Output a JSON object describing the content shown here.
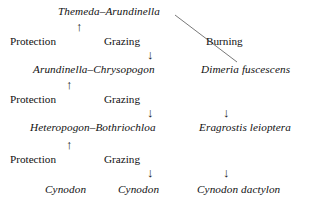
{
  "diagram": {
    "background_color": "#ffffff",
    "text_color": "#111111",
    "nodes": [
      {
        "label": "Themeda–Arundinella",
        "x": 58,
        "y": 6
      },
      {
        "label": "Arundinella–Chrysopogon",
        "x": 33,
        "y": 64
      },
      {
        "label": "Dimeria fuscescens",
        "x": 201,
        "y": 64
      },
      {
        "label": "Heteropogon–Bothriochloa",
        "x": 30,
        "y": 122
      },
      {
        "label": "Eragrostis leioptera",
        "x": 199,
        "y": 122
      },
      {
        "label": "Cynodon",
        "x": 45,
        "y": 184
      },
      {
        "label": "Cynodon",
        "x": 118,
        "y": 184
      },
      {
        "label": "Cynodon dactylon",
        "x": 197,
        "y": 184
      }
    ],
    "factors": [
      {
        "label": "Protection",
        "x": 10,
        "y": 36
      },
      {
        "label": "Grazing",
        "x": 104,
        "y": 36
      },
      {
        "label": "Burning",
        "x": 206,
        "y": 36
      },
      {
        "label": "Protection",
        "x": 10,
        "y": 94
      },
      {
        "label": "Grazing",
        "x": 104,
        "y": 94
      },
      {
        "label": "Protection",
        "x": 10,
        "y": 154
      },
      {
        "label": "Grazing",
        "x": 104,
        "y": 154
      }
    ],
    "arrows": [
      {
        "glyph": "arrow-up",
        "direction": "up",
        "x": 76,
        "y": 20
      },
      {
        "glyph": "arrow-down",
        "direction": "down",
        "x": 147,
        "y": 48
      },
      {
        "glyph": "arrow-up",
        "direction": "up",
        "x": 66,
        "y": 78
      },
      {
        "glyph": "arrow-down",
        "direction": "down",
        "x": 147,
        "y": 106
      },
      {
        "glyph": "arrow-down",
        "direction": "down",
        "x": 223,
        "y": 106
      },
      {
        "glyph": "arrow-up",
        "direction": "up",
        "x": 66,
        "y": 138
      },
      {
        "glyph": "arrow-down",
        "direction": "down",
        "x": 147,
        "y": 166
      },
      {
        "glyph": "arrow-down",
        "direction": "down",
        "x": 223,
        "y": 166
      }
    ],
    "connector": {
      "name": "burning-diagonal",
      "x1": 175,
      "y1": 15,
      "x2": 237,
      "y2": 62,
      "color": "#555555",
      "width": 0.8
    }
  }
}
